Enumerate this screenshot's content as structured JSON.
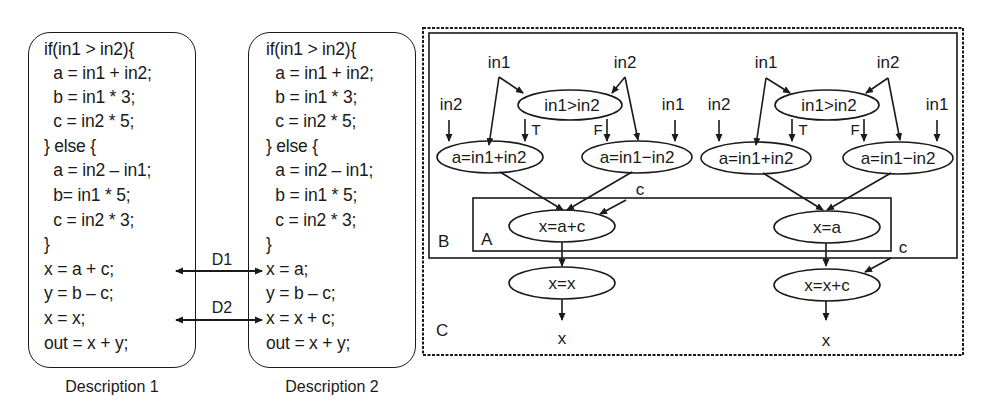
{
  "description1": {
    "caption": "Description 1",
    "lines": [
      "if(in1 > in2){",
      "  a = in1 + in2;",
      "  b = in1 * 3;",
      "  c = in2 * 5;",
      "} else {",
      "  a = in2 – in1;",
      "  b= in1 * 5;",
      "  c = in2 * 3;",
      "}",
      "x = a + c;",
      "y = b – c;",
      "x = x;",
      "out = x + y;"
    ]
  },
  "description2": {
    "caption": "Description 2",
    "lines": [
      "if(in1 > in2){",
      "  a = in1 + in2;",
      "  b = in1 * 3;",
      "  c = in2 * 5;",
      "} else {",
      "  a = in2 – in1;",
      "  b = in1 * 5;",
      "  c = in2 * 3;",
      "}",
      "x = a;",
      "y = b – c;",
      "x = x + c;",
      "out = x + y;"
    ]
  },
  "differences": [
    {
      "label": "D1"
    },
    {
      "label": "D2"
    }
  ],
  "regions": {
    "a": "A",
    "b": "B",
    "c": "C"
  },
  "graph1": {
    "input_in1_top": "in1",
    "input_in2_top": "in2",
    "input_in2_left": "in2",
    "input_in1_right": "in1",
    "condition": "in1>in2",
    "true_label": "T",
    "false_label": "F",
    "then_node": "a=in1+in2",
    "else_node": "a=in1−in2",
    "c_input": "c",
    "merge_node": "x=a+c",
    "final_node": "x=x",
    "output": "x"
  },
  "graph2": {
    "input_in1_top": "in1",
    "input_in2_top": "in2",
    "input_in2_left": "in2",
    "input_in1_right": "in1",
    "condition": "in1>in2",
    "true_label": "T",
    "false_label": "F",
    "then_node": "a=in1+in2",
    "else_node": "a=in1−in2",
    "c_input": "c",
    "merge_node": "x=a",
    "final_node": "x=x+c",
    "output": "x"
  }
}
